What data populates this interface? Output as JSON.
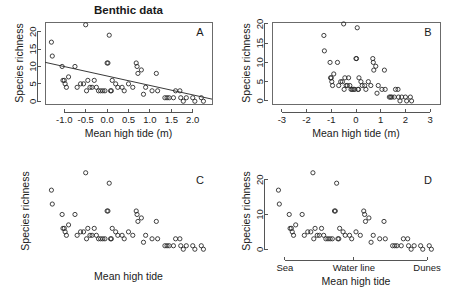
{
  "figure": {
    "title": "Benthic data",
    "panel_letters": [
      "A",
      "B",
      "C",
      "D"
    ]
  },
  "chart_data": [
    {
      "id": "A",
      "type": "scatter",
      "title": "Benthic data",
      "panel_letter": "A",
      "xlabel": "Mean high tide (m)",
      "ylabel": "Species richness",
      "xlim": [
        -1.45,
        2.45
      ],
      "ylim": [
        -0.8,
        22.8
      ],
      "xticks": [
        -1.0,
        -0.5,
        0.0,
        0.5,
        1.0,
        1.5,
        2.0
      ],
      "xticklabels": [
        "-1.0",
        "-0.5",
        "0.0",
        "0.5",
        "1.0",
        "1.5",
        "2.0"
      ],
      "yticks": [
        0,
        5,
        10,
        15,
        20
      ],
      "yticklabels": [
        "0",
        "5",
        "10",
        "15",
        "20"
      ],
      "box": true,
      "grid": false,
      "legend": "none",
      "fit_line": {
        "x0": -1.45,
        "y0": 11.2,
        "x1": 2.45,
        "y1": 0.6
      },
      "x": [
        -1.3,
        -1.28,
        -1.05,
        -1.03,
        -1.0,
        -0.98,
        -0.95,
        -0.9,
        -0.75,
        -0.7,
        -0.62,
        -0.55,
        -0.5,
        -0.48,
        -0.45,
        -0.4,
        -0.35,
        -0.3,
        -0.25,
        -0.2,
        -0.15,
        -0.1,
        -0.05,
        0.0,
        0.02,
        0.05,
        0.08,
        0.1,
        0.12,
        0.2,
        0.25,
        0.35,
        0.4,
        0.5,
        0.6,
        0.68,
        0.7,
        0.72,
        0.8,
        0.85,
        0.9,
        1.05,
        1.15,
        1.18,
        1.35,
        1.4,
        1.45,
        1.55,
        1.6,
        1.7,
        1.72,
        1.78,
        1.85,
        2.0,
        2.05,
        2.2,
        2.25
      ],
      "y": [
        17,
        13,
        10,
        6,
        6,
        5,
        4,
        7,
        10,
        4,
        5,
        5,
        22,
        3,
        6,
        4,
        4,
        6,
        4,
        3,
        3,
        3,
        3,
        11,
        11,
        19,
        3,
        3,
        6,
        5,
        4,
        4,
        3,
        5,
        4,
        11,
        10,
        8,
        9,
        2,
        4,
        3,
        8,
        3,
        1,
        1,
        1,
        1,
        3,
        3,
        1,
        0,
        1,
        1,
        0,
        1,
        0
      ]
    },
    {
      "id": "B",
      "type": "scatter",
      "panel_letter": "B",
      "xlabel": "Mean high tide (m)",
      "ylabel": "Species richness",
      "xlim": [
        -3.4,
        3.4
      ],
      "ylim": [
        -0.8,
        20.5
      ],
      "xticks": [
        -3,
        -2,
        -1,
        0,
        1,
        2,
        3
      ],
      "xticklabels": [
        "-3",
        "-2",
        "-1",
        "0",
        "1",
        "2",
        "3"
      ],
      "yticks": [
        0,
        5,
        10,
        15,
        20
      ],
      "yticklabels": [
        "0",
        "5",
        "10",
        "15",
        "20"
      ],
      "box": true,
      "grid": false,
      "legend": "none",
      "x": [
        -1.3,
        -1.28,
        -1.05,
        -1.03,
        -1.0,
        -0.98,
        -0.95,
        -0.9,
        -0.75,
        -0.7,
        -0.62,
        -0.55,
        -0.5,
        -0.48,
        -0.45,
        -0.4,
        -0.35,
        -0.3,
        -0.25,
        -0.2,
        -0.15,
        -0.1,
        -0.05,
        0.0,
        0.02,
        0.05,
        0.08,
        0.1,
        0.12,
        0.2,
        0.25,
        0.35,
        0.4,
        0.5,
        0.6,
        0.68,
        0.7,
        0.72,
        0.8,
        0.85,
        0.9,
        1.05,
        1.15,
        1.18,
        1.35,
        1.4,
        1.45,
        1.55,
        1.6,
        1.7,
        1.72,
        1.78,
        1.85,
        2.0,
        2.05,
        2.2,
        2.25
      ],
      "y": [
        17,
        13,
        10,
        6,
        6,
        5,
        4,
        7,
        10,
        4,
        5,
        5,
        20,
        3,
        6,
        4,
        4,
        6,
        4,
        3,
        3,
        3,
        3,
        11,
        11,
        19,
        3,
        3,
        6,
        5,
        4,
        4,
        3,
        5,
        4,
        11,
        10,
        8,
        9,
        2,
        4,
        3,
        8,
        3,
        1,
        1,
        1,
        1,
        3,
        3,
        1,
        0,
        1,
        1,
        0,
        1,
        0
      ]
    },
    {
      "id": "C",
      "type": "scatter",
      "panel_letter": "C",
      "xlabel": "Mean high tide",
      "ylabel": "Species richness",
      "xlim": [
        -1.45,
        2.45
      ],
      "ylim": [
        -0.8,
        22.8
      ],
      "xticks": [],
      "xticklabels": [],
      "yticks": [],
      "yticklabels": [],
      "box": false,
      "grid": false,
      "legend": "none",
      "x": [
        -1.3,
        -1.28,
        -1.05,
        -1.03,
        -1.0,
        -0.98,
        -0.95,
        -0.9,
        -0.75,
        -0.7,
        -0.62,
        -0.55,
        -0.5,
        -0.48,
        -0.45,
        -0.4,
        -0.35,
        -0.3,
        -0.25,
        -0.2,
        -0.15,
        -0.1,
        -0.05,
        0.0,
        0.02,
        0.05,
        0.08,
        0.1,
        0.12,
        0.2,
        0.25,
        0.35,
        0.4,
        0.5,
        0.6,
        0.68,
        0.7,
        0.72,
        0.8,
        0.85,
        0.9,
        1.05,
        1.15,
        1.18,
        1.35,
        1.4,
        1.45,
        1.55,
        1.6,
        1.7,
        1.72,
        1.78,
        1.85,
        2.0,
        2.05,
        2.2,
        2.25
      ],
      "y": [
        17,
        13,
        10,
        6,
        6,
        5,
        4,
        7,
        10,
        4,
        5,
        5,
        22,
        3,
        6,
        4,
        4,
        6,
        4,
        3,
        3,
        3,
        3,
        11,
        11,
        19,
        3,
        3,
        6,
        5,
        4,
        4,
        3,
        5,
        4,
        11,
        10,
        8,
        9,
        2,
        4,
        3,
        8,
        3,
        1,
        1,
        1,
        1,
        3,
        3,
        1,
        0,
        1,
        1,
        0,
        1,
        0
      ]
    },
    {
      "id": "D",
      "type": "scatter",
      "panel_letter": "D",
      "xlabel": "Mean high tide",
      "ylabel": "Species richness",
      "xlim": [
        -1.45,
        2.45
      ],
      "ylim": [
        -0.8,
        22.8
      ],
      "xticks": [
        -1.15,
        0.45,
        2.15
      ],
      "xticklabels": [
        "Sea",
        "Water line",
        "Dunes"
      ],
      "yticks": [
        0,
        10,
        20
      ],
      "yticklabels": [
        "0",
        "10",
        "20"
      ],
      "box": false,
      "grid": false,
      "legend": "none",
      "x": [
        -1.3,
        -1.28,
        -1.05,
        -1.03,
        -1.0,
        -0.98,
        -0.95,
        -0.9,
        -0.75,
        -0.7,
        -0.62,
        -0.55,
        -0.5,
        -0.48,
        -0.45,
        -0.4,
        -0.35,
        -0.3,
        -0.25,
        -0.2,
        -0.15,
        -0.1,
        -0.05,
        0.0,
        0.02,
        0.05,
        0.08,
        0.1,
        0.12,
        0.2,
        0.25,
        0.35,
        0.4,
        0.5,
        0.6,
        0.68,
        0.7,
        0.72,
        0.8,
        0.85,
        0.9,
        1.05,
        1.15,
        1.18,
        1.35,
        1.4,
        1.45,
        1.55,
        1.6,
        1.7,
        1.72,
        1.78,
        1.85,
        2.0,
        2.05,
        2.2,
        2.25
      ],
      "y": [
        17,
        13,
        10,
        6,
        6,
        5,
        4,
        7,
        10,
        4,
        5,
        5,
        22,
        3,
        6,
        4,
        4,
        6,
        4,
        3,
        3,
        3,
        3,
        11,
        11,
        19,
        3,
        3,
        6,
        5,
        4,
        4,
        3,
        5,
        4,
        11,
        10,
        8,
        9,
        2,
        4,
        3,
        8,
        3,
        1,
        1,
        1,
        1,
        3,
        3,
        1,
        0,
        1,
        1,
        0,
        1,
        0
      ]
    }
  ]
}
